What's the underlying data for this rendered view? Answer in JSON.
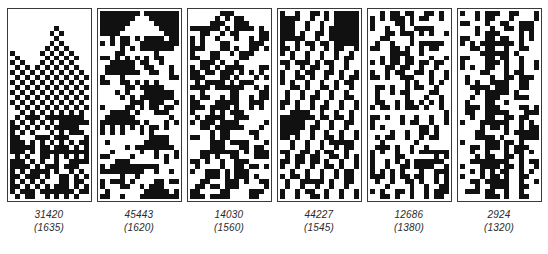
{
  "figure": {
    "name": "evolved-pattern-panels",
    "background_color": "#ffffff",
    "ink_color": "#111111",
    "border_color": "#3a3a3a",
    "label_color": "#2b2b2b",
    "panel_count": 6,
    "grid": {
      "columns": 16,
      "rows": 38,
      "cell_px": 5
    }
  },
  "panels": [
    {
      "id": "panel-1",
      "label_primary": "31420",
      "label_secondary": "(1635)",
      "fitness": 31420,
      "generation": 1635,
      "pattern_description": "checkerboard-dither-triangles",
      "seed": 31420
    },
    {
      "id": "panel-2",
      "label_primary": "45443",
      "label_secondary": "(1620)",
      "fitness": 45443,
      "generation": 1620,
      "pattern_description": "stacked-triangle-motifs",
      "seed": 45443
    },
    {
      "id": "panel-3",
      "label_primary": "14030",
      "label_secondary": "(1560)",
      "fitness": 14030,
      "generation": 1560,
      "pattern_description": "blocky-maze-texture",
      "seed": 14030
    },
    {
      "id": "panel-4",
      "label_primary": "44227",
      "label_secondary": "(1545)",
      "fitness": 44227,
      "generation": 1545,
      "pattern_description": "diagonal-stripes-with-solid-fields",
      "seed": 44227
    },
    {
      "id": "panel-5",
      "label_primary": "12686",
      "label_secondary": "(1380)",
      "fitness": 12686,
      "generation": 1380,
      "pattern_description": "sparse-diagonal-speckle",
      "seed": 12686
    },
    {
      "id": "panel-6",
      "label_primary": "2924",
      "label_secondary": "(1320)",
      "fitness": 2924,
      "generation": 1320,
      "pattern_description": "vertical-bars-speckle",
      "seed": 2924
    }
  ],
  "chart_data": {
    "type": "heatmap",
    "title": "",
    "xlabel": "",
    "ylabel": "",
    "legend": [],
    "grid": false,
    "categories": [
      "31420",
      "45443",
      "14030",
      "44227",
      "12686",
      "2924"
    ],
    "series": [
      {
        "name": "fitness",
        "values": [
          31420,
          45443,
          14030,
          44227,
          12686,
          2924
        ]
      },
      {
        "name": "generation",
        "values": [
          1635,
          1620,
          1560,
          1545,
          1380,
          1320
        ]
      }
    ],
    "annotations": [
      "31420 (1635)",
      "45443 (1620)",
      "14030 (1560)",
      "44227 (1545)",
      "12686 (1380)",
      "2924 (1320)"
    ]
  }
}
